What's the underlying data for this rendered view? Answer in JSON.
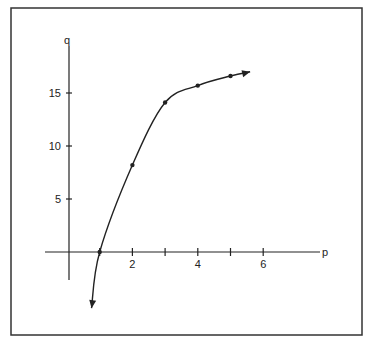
{
  "chart_data": {
    "type": "line",
    "title": "",
    "xlabel": "p",
    "ylabel": "q",
    "x_ticks": [
      1,
      2,
      3,
      4,
      5,
      6
    ],
    "x_tick_labels": [
      "2",
      "4",
      "6"
    ],
    "y_ticks": [
      5,
      10,
      15
    ],
    "y_tick_labels": [
      "5",
      "10",
      "15"
    ],
    "xlim": [
      -0.7,
      8.1
    ],
    "ylim": [
      -6.4,
      17.2
    ],
    "grid": false,
    "legend": null,
    "series": [
      {
        "name": "q(p)",
        "marked_points": [
          {
            "p": 1,
            "q": 0
          },
          {
            "p": 2,
            "q": 8.2
          },
          {
            "p": 3,
            "q": 14.1
          },
          {
            "p": 4,
            "q": 15.7
          },
          {
            "p": 5,
            "q": 16.6
          }
        ],
        "curve_start": {
          "p": 0.75,
          "q": -5.3,
          "arrow": true
        },
        "curve_end": {
          "p": 5.6,
          "q": 17.0,
          "arrow": true
        }
      }
    ]
  },
  "axes": {
    "x_label": "p",
    "y_label": "q"
  },
  "colors": {
    "line": "#222222",
    "frame": "#333333",
    "background": "#ffffff"
  }
}
